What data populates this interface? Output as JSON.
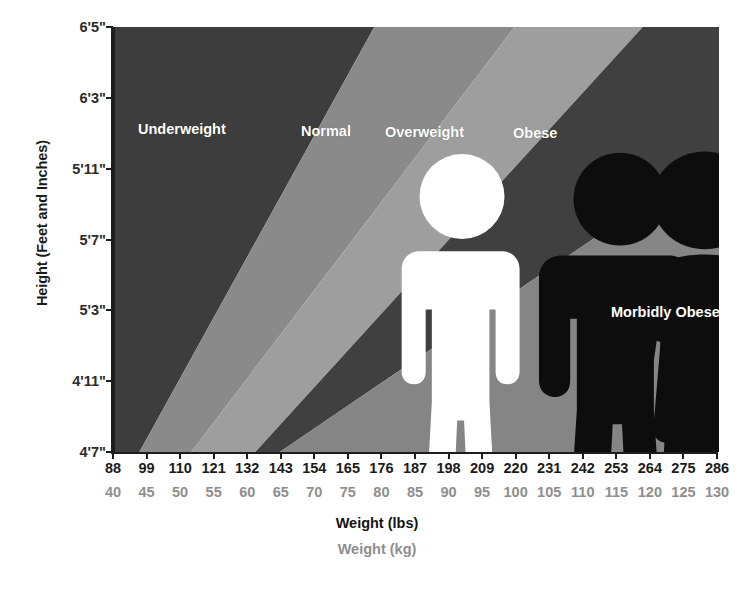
{
  "chart_data": {
    "type": "area",
    "title": "",
    "subtitle": "",
    "xlabel": "Weight (lbs)",
    "xlabel_secondary": "Weight (kg)",
    "ylabel": "Height (Feet and Inches)",
    "grid": false,
    "legend_position": "in-plot-labels",
    "x_ticks_lbs": [
      88,
      99,
      110,
      121,
      132,
      143,
      154,
      165,
      176,
      187,
      198,
      209,
      220,
      231,
      242,
      253,
      264,
      275,
      286
    ],
    "x_ticks_kg": [
      40,
      45,
      50,
      55,
      60,
      65,
      70,
      75,
      80,
      85,
      90,
      95,
      100,
      105,
      110,
      115,
      120,
      125,
      130
    ],
    "y_ticks": [
      "6'5\"",
      "6'3\"",
      "5'11\"",
      "5'7\"",
      "5'3\"",
      "4'11\"",
      "4'7\""
    ],
    "y_ticks_inches": [
      77,
      75,
      71,
      67,
      63,
      59,
      55
    ],
    "xlim_lbs": [
      88,
      286
    ],
    "xlim_kg": [
      40,
      130
    ],
    "ylim_inches": [
      55,
      77
    ],
    "categories": [
      {
        "name": "Underweight",
        "label": "Underweight",
        "color": "#3d3d3d",
        "bmi_range": "under 18.5",
        "label_x_lbs": 110,
        "figure": "person-thin",
        "figure_color": "#ffffff"
      },
      {
        "name": "Normal",
        "label": "Normal",
        "color": "#8a8a8a",
        "bmi_range": "18.5 - 24.9",
        "label_x_lbs": 152,
        "figure": "person-normal",
        "figure_color": "#0d0d0d"
      },
      {
        "name": "Overweight",
        "label": "Overweight",
        "color": "#9e9e9e",
        "bmi_range": "25 - 29.9",
        "label_x_lbs": 188,
        "figure": "person-overweight",
        "figure_color": "#0d0d0d"
      },
      {
        "name": "Obese",
        "label": "Obese",
        "color": "#404040",
        "bmi_range": "30 - 39.9",
        "label_x_lbs": 227,
        "figure": "person-obese",
        "figure_color": "#0d0d0d"
      },
      {
        "name": "Morbidly Obese",
        "label": "Morbidly Obese",
        "color": "#858585",
        "bmi_range": "40 and over",
        "label_x_lbs": 250,
        "figure": "person-morbidly-obese",
        "figure_color": "#0d0d0d"
      }
    ],
    "band_boundaries": {
      "note": "x position (lbs) of each band's right edge, at the top row (6'5\") and bottom row (4'7\") of the plot",
      "underweight_normal": {
        "top_lbs": 173,
        "bottom_lbs": 96
      },
      "normal_overweight": {
        "top_lbs": 219,
        "bottom_lbs": 113
      },
      "overweight_obese": {
        "top_lbs": 261,
        "bottom_lbs": 134
      },
      "obese_morbidly_obese": {
        "top_lbs": 347,
        "bottom_lbs": 142
      }
    }
  },
  "axes": {
    "y_title": "Height (Feet and Inches)",
    "x_title_lbs": "Weight (lbs)",
    "x_title_kg": "Weight (kg)"
  },
  "colors": {
    "underweight": "#3d3d3d",
    "normal": "#8a8a8a",
    "overweight": "#9e9e9e",
    "obese": "#404040",
    "morbidly_obese": "#858585",
    "axis": "#1d1d1d",
    "label_text": "#ffffff",
    "kg_text": "#8e8e8e",
    "background": "#ffffff"
  }
}
